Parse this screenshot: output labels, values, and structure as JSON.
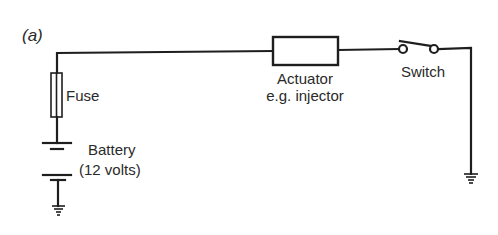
{
  "figure": {
    "label": "(a)",
    "type": "circuit schematic",
    "stroke_color": "#1e1e1e",
    "text_color": "#2a2a2a",
    "background": "#ffffff"
  },
  "components": {
    "fuse": {
      "label": "Fuse",
      "icon": "fuse-icon"
    },
    "battery": {
      "label_line1": "Battery",
      "label_line2": "(12 volts)",
      "icon": "battery-icon"
    },
    "actuator": {
      "label_line1": "Actuator",
      "label_line2": "e.g. injector",
      "icon": "resistor-box-icon"
    },
    "switch": {
      "label": "Switch",
      "state": "open",
      "icon": "switch-icon"
    },
    "ground_left": {
      "icon": "ground-icon"
    },
    "ground_right": {
      "icon": "ground-icon"
    }
  }
}
